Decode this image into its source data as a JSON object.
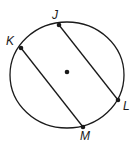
{
  "diagram": {
    "type": "circle-with-chords",
    "circle": {
      "cx": 67,
      "cy": 75,
      "rx": 57,
      "ry": 53,
      "stroke": "#1a1a1a"
    },
    "center_point": {
      "x": 67,
      "y": 72
    },
    "points": [
      {
        "label": "J",
        "x": 59,
        "y": 25,
        "label_x": 52,
        "label_y": 19
      },
      {
        "label": "K",
        "x": 21,
        "y": 48,
        "label_x": 6,
        "label_y": 45
      },
      {
        "label": "L",
        "x": 118,
        "y": 100,
        "label_x": 123,
        "label_y": 110
      },
      {
        "label": "M",
        "x": 83,
        "y": 127,
        "label_x": 82,
        "label_y": 140
      }
    ],
    "chords": [
      {
        "from": "J",
        "to": "L"
      },
      {
        "from": "K",
        "to": "M"
      }
    ]
  }
}
